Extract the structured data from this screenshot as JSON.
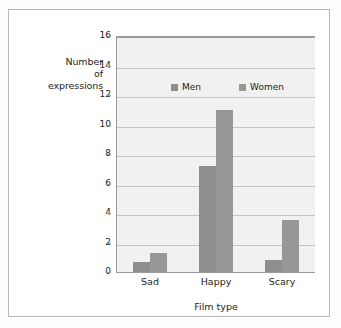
{
  "chart_data": {
    "type": "bar",
    "title": "",
    "xlabel": "Film type",
    "ylabel": "Number of expressions",
    "ylabel_lines": [
      "Number",
      "of",
      "expressions"
    ],
    "categories": [
      "Sad",
      "Happy",
      "Scary"
    ],
    "series": [
      {
        "name": "Men",
        "values": [
          0.7,
          7.2,
          0.8
        ],
        "color": "#8e8e8e"
      },
      {
        "name": "Women",
        "values": [
          1.3,
          11.0,
          3.5
        ],
        "color": "#979797"
      }
    ],
    "ylim": [
      0,
      16
    ],
    "ytick_labels": [
      "16",
      "14",
      "12",
      "10",
      "8",
      "6",
      "4",
      "2",
      "0"
    ],
    "ytick_values": [
      16,
      14,
      12,
      10,
      8,
      6,
      4,
      2,
      0
    ],
    "grid": true,
    "legend_position": "inside-top-center",
    "plot_background": "#f1f1f1",
    "gridline_color": "#c4c4c4",
    "axis_color": "#9a9a9a",
    "frame_color": "#b9b9b9"
  }
}
